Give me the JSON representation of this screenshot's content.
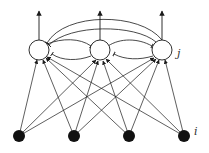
{
  "diagram": {
    "type": "neural-network",
    "colors": {
      "stroke": "#1a1a1a",
      "input_fill": "#111111",
      "output_fill": "#ffffff",
      "background": "#ffffff"
    },
    "labels": {
      "output_layer": "j",
      "input_layer": "i"
    },
    "output_nodes": [
      {
        "id": "o1",
        "x": 39,
        "y": 50
      },
      {
        "id": "o2",
        "x": 100,
        "y": 50
      },
      {
        "id": "o3",
        "x": 162,
        "y": 50
      }
    ],
    "input_nodes": [
      {
        "id": "i1",
        "x": 19,
        "y": 136
      },
      {
        "id": "i2",
        "x": 74,
        "y": 136
      },
      {
        "id": "i3",
        "x": 129,
        "y": 136
      },
      {
        "id": "i4",
        "x": 184,
        "y": 136
      }
    ],
    "connections": {
      "feedforward": "all input nodes to all output nodes (arrowheads)",
      "outputs": "each output node has an upward arrow",
      "lateral": "inhibitory (bar-ended) connections between output nodes, including long arcs between o1 and o3"
    }
  }
}
